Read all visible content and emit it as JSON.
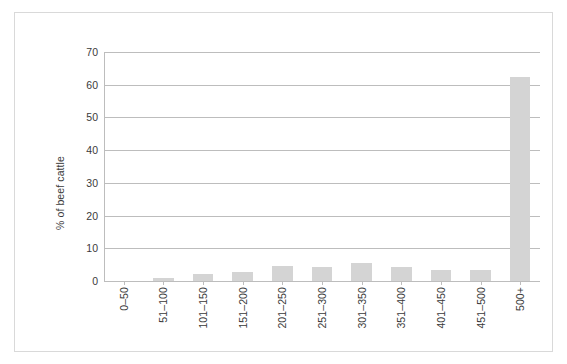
{
  "chart_data": {
    "type": "bar",
    "title": "",
    "subtitle": "",
    "xlabel": "",
    "ylabel": "% of beef cattle",
    "categories": [
      "0–50",
      "51–100",
      "101–150",
      "151–200",
      "201–250",
      "251–300",
      "301–350",
      "351–400",
      "401–450",
      "451–500",
      "500+"
    ],
    "values": [
      0,
      1.0,
      2.0,
      2.7,
      4.6,
      4.4,
      5.6,
      4.4,
      3.5,
      3.5,
      62.5
    ],
    "series": [
      {
        "name": "% of beef cattle",
        "values": [
          0,
          1.0,
          2.0,
          2.7,
          4.6,
          4.4,
          5.6,
          4.4,
          3.5,
          3.5,
          62.5
        ]
      }
    ],
    "ylim": [
      0,
      70
    ],
    "yticks": [
      0,
      10,
      20,
      30,
      40,
      50,
      60,
      70
    ],
    "ytick_labels": [
      "0",
      "10",
      "20",
      "30",
      "40",
      "50",
      "60",
      "70"
    ],
    "grid": "horizontal",
    "legend": "none",
    "annotations": [],
    "colors": {
      "bar_fill": "#d4d4d4",
      "gridline": "#bdbdbd",
      "text": "#3a3a3a",
      "frame": "#d9d9d9",
      "background": "#ffffff"
    }
  }
}
